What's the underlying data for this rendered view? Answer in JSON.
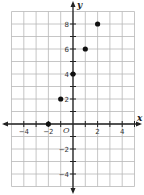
{
  "chart_data": {
    "type": "scatter",
    "title": "",
    "xlabel": "x",
    "ylabel": "y",
    "origin_label": "O",
    "xlim": [
      -5,
      5
    ],
    "ylim": [
      -5,
      9
    ],
    "grid": true,
    "x_ticks": [
      -4,
      -2,
      2,
      4
    ],
    "y_ticks": [
      8,
      6,
      4,
      2,
      -2,
      -4
    ],
    "x_tick_labels": [
      "−4",
      "−2",
      "2",
      "4"
    ],
    "y_tick_labels": [
      "8",
      "6",
      "4",
      "2",
      "−2",
      "−4"
    ],
    "points": [
      {
        "x": -2,
        "y": 0
      },
      {
        "x": -1,
        "y": 2
      },
      {
        "x": 0,
        "y": 4
      },
      {
        "x": 1,
        "y": 6
      },
      {
        "x": 2,
        "y": 8
      }
    ],
    "colors": {
      "grid": "#b8b8b8",
      "axis": "#222222",
      "point": "#111111"
    }
  }
}
